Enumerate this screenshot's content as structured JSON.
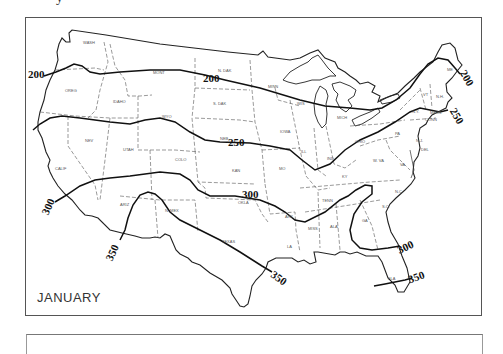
{
  "map": {
    "title": "JANUARY",
    "type": "isoline map",
    "region": "Contiguous United States",
    "contour_unit_values": [
      200,
      250,
      300,
      350
    ],
    "contours": [
      {
        "value": 200,
        "labels": [
          {
            "text": "200",
            "x": 30,
            "y": 77
          },
          {
            "text": "200",
            "x": 205,
            "y": 81
          },
          {
            "text": "200",
            "x": 467,
            "y": 80
          }
        ]
      },
      {
        "value": 250,
        "labels": [
          {
            "text": "250",
            "x": 233,
            "y": 143
          },
          {
            "text": "250",
            "x": 460,
            "y": 116
          }
        ]
      },
      {
        "value": 300,
        "labels": [
          {
            "text": "300",
            "x": 48,
            "y": 205
          },
          {
            "text": "300",
            "x": 244,
            "y": 196
          },
          {
            "text": "300",
            "x": 400,
            "y": 247
          }
        ]
      },
      {
        "value": 350,
        "labels": [
          {
            "text": "350",
            "x": 112,
            "y": 250
          },
          {
            "text": "350",
            "x": 280,
            "y": 275
          },
          {
            "text": "350",
            "x": 414,
            "y": 276
          }
        ]
      }
    ],
    "state_labels": [
      {
        "text": "WASH",
        "x": 83,
        "y": 44
      },
      {
        "text": "MONT",
        "x": 153,
        "y": 74
      },
      {
        "text": "N. DAK",
        "x": 218,
        "y": 72
      },
      {
        "text": "OREG",
        "x": 65,
        "y": 92
      },
      {
        "text": "IDAHO",
        "x": 113,
        "y": 103
      },
      {
        "text": "S. DAK",
        "x": 213,
        "y": 105
      },
      {
        "text": "WYO",
        "x": 162,
        "y": 118
      },
      {
        "text": "NEB",
        "x": 220,
        "y": 140
      },
      {
        "text": "IOWA",
        "x": 280,
        "y": 133
      },
      {
        "text": "NEV",
        "x": 85,
        "y": 142
      },
      {
        "text": "UTAH",
        "x": 123,
        "y": 151
      },
      {
        "text": "COLO",
        "x": 175,
        "y": 161
      },
      {
        "text": "KAN",
        "x": 232,
        "y": 172
      },
      {
        "text": "MO",
        "x": 279,
        "y": 170
      },
      {
        "text": "CALIF",
        "x": 55,
        "y": 170
      },
      {
        "text": "ARIZ",
        "x": 120,
        "y": 206
      },
      {
        "text": "N. MEX",
        "x": 165,
        "y": 212
      },
      {
        "text": "OKLA",
        "x": 238,
        "y": 204
      },
      {
        "text": "TEXAS",
        "x": 222,
        "y": 243
      },
      {
        "text": "ARK",
        "x": 285,
        "y": 218
      },
      {
        "text": "LA",
        "x": 287,
        "y": 248
      },
      {
        "text": "MISS",
        "x": 308,
        "y": 230
      },
      {
        "text": "ALA",
        "x": 330,
        "y": 228
      },
      {
        "text": "GA",
        "x": 362,
        "y": 222
      },
      {
        "text": "FLA",
        "x": 388,
        "y": 280
      },
      {
        "text": "S.C.",
        "x": 382,
        "y": 208
      },
      {
        "text": "N.C.",
        "x": 395,
        "y": 193
      },
      {
        "text": "TENN",
        "x": 322,
        "y": 202
      },
      {
        "text": "KY",
        "x": 342,
        "y": 178
      },
      {
        "text": "W. VA",
        "x": 373,
        "y": 162
      },
      {
        "text": "VA",
        "x": 400,
        "y": 166
      },
      {
        "text": "ILL",
        "x": 301,
        "y": 153
      },
      {
        "text": "IND",
        "x": 327,
        "y": 160
      },
      {
        "text": "OHIO",
        "x": 355,
        "y": 143
      },
      {
        "text": "MICH",
        "x": 337,
        "y": 119
      },
      {
        "text": "WIS",
        "x": 297,
        "y": 105
      },
      {
        "text": "MINN",
        "x": 268,
        "y": 88
      },
      {
        "text": "PA",
        "x": 395,
        "y": 135
      },
      {
        "text": "N.Y.",
        "x": 412,
        "y": 113
      },
      {
        "text": "VT",
        "x": 423,
        "y": 96
      },
      {
        "text": "N.H.",
        "x": 436,
        "y": 98
      },
      {
        "text": "ME",
        "x": 447,
        "y": 71
      },
      {
        "text": "MASS",
        "x": 430,
        "y": 114
      },
      {
        "text": "CONN",
        "x": 425,
        "y": 121
      },
      {
        "text": "N.J.",
        "x": 416,
        "y": 142
      },
      {
        "text": "DEL",
        "x": 421,
        "y": 151
      }
    ]
  }
}
